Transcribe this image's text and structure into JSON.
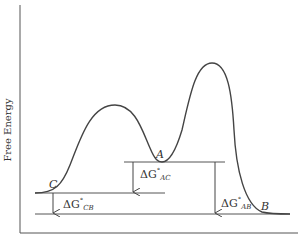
{
  "diagram": {
    "type": "free-energy-profile",
    "y_axis_label": "Free Energy",
    "colors": {
      "line": "#444444",
      "text": "#333333",
      "background": "#ffffff"
    },
    "states": [
      {
        "id": "C",
        "label": "C"
      },
      {
        "id": "A",
        "label": "A"
      },
      {
        "id": "B",
        "label": "B"
      }
    ],
    "energy_differences": [
      {
        "id": "AC",
        "delta": "ΔG",
        "sup": "°",
        "sub": "AC"
      },
      {
        "id": "CB",
        "delta": "ΔG",
        "sup": "°",
        "sub": "CB"
      },
      {
        "id": "AB",
        "delta": "ΔG",
        "sup": "°",
        "sub": "AB"
      }
    ]
  }
}
